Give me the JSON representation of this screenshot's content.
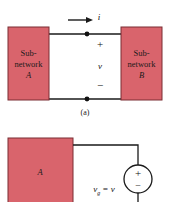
{
  "figure": {
    "caption_a": "(a)",
    "colors": {
      "block_fill": "#d9646c",
      "block_border": "#7a2d33",
      "wire": "#1a1a1a",
      "background": "#ffffff"
    }
  },
  "panel_a": {
    "name": "two-terminal-network-pair",
    "left_block": {
      "line1": "Sub-",
      "line2": "network",
      "line3": "A"
    },
    "right_block": {
      "line1": "Sub-",
      "line2": "network",
      "line3": "B"
    },
    "current_label": "i",
    "voltage_label": "v",
    "plus_sign": "+",
    "minus_sign": "−"
  },
  "panel_b": {
    "name": "network-with-source",
    "block_label": "A",
    "source_plus": "+",
    "source_minus": "−",
    "source_label_main": "v",
    "source_label_sub": "g",
    "source_label_rest": "= v"
  }
}
